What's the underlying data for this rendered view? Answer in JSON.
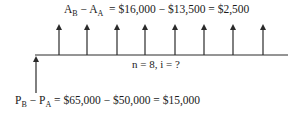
{
  "diagram": {
    "type": "cash-flow-diagram",
    "top_label": {
      "lhs_a": "A",
      "lhs_a_sub": "B",
      "minus": " − ",
      "lhs_b": "A",
      "lhs_b_sub": "A",
      "rhs": "  = $16,000 − $13,500 = $2,500"
    },
    "middle_label": "n = 8, i = ?",
    "bottom_label": {
      "lhs_a": "P",
      "lhs_a_sub": "B",
      "minus": " − ",
      "lhs_b": "P",
      "lhs_b_sub": "A",
      "rhs": " = $65,000 − $50,000 = $15,000"
    },
    "timeline": {
      "x_start": 35,
      "x_end": 288,
      "y": 55
    },
    "initial_arrow": {
      "x": 36,
      "y_from": 93,
      "y_to": 57,
      "direction": "up",
      "value": "$15,000"
    },
    "periodic_arrows": {
      "count": 8,
      "x": [
        59,
        87,
        117,
        145,
        175,
        204,
        233,
        263
      ],
      "y_top": 24,
      "direction": "up",
      "value": "$2,500"
    },
    "colors": {
      "line": "#2a2a2a",
      "text": "#1a1a1a",
      "background": "#ffffff"
    }
  }
}
